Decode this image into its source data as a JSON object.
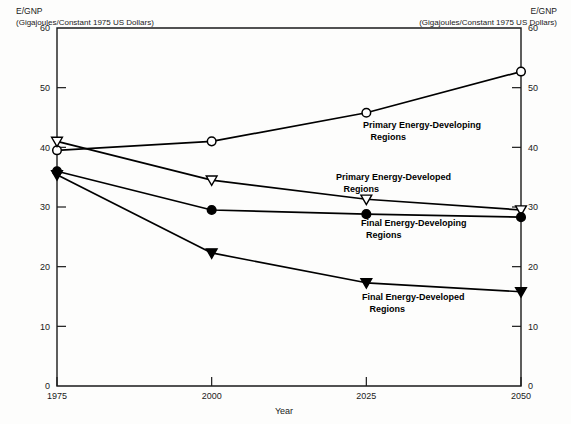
{
  "chart_data": {
    "type": "line",
    "title": "",
    "xlabel": "Year",
    "ylabel": "E/GNP",
    "ylabel_unit": "(Gigajoules/Constant 1975 US Dollars)",
    "x": [
      1975,
      2000,
      2025,
      2050
    ],
    "xtick_labels": [
      "1975",
      "2000",
      "2025",
      "2050"
    ],
    "ytick_labels": [
      "0",
      "10",
      "20",
      "30",
      "40",
      "50",
      "60"
    ],
    "yticks": [
      0,
      10,
      20,
      30,
      40,
      50,
      60
    ],
    "ylim": [
      0,
      60
    ],
    "xlim": [
      1975,
      2050
    ],
    "grid": false,
    "legend_position": "inline-annotations",
    "dual_y_axis": true,
    "series": [
      {
        "name": "Primary Energy-Developing Regions",
        "label": "Primary Energy-Developing\n   Regions",
        "marker": "open-circle",
        "values": [
          39.5,
          41.0,
          45.8,
          52.7
        ]
      },
      {
        "name": "Primary Energy-Developed Regions",
        "label": "Primary Energy-Developed\n   Regions",
        "marker": "open-triangle-down",
        "values": [
          41.0,
          34.5,
          31.3,
          29.5
        ]
      },
      {
        "name": "Final Energy-Developing Regions",
        "label": "Final Energy-Developing\n  Regions",
        "marker": "filled-circle",
        "values": [
          36.0,
          29.5,
          28.8,
          28.3
        ]
      },
      {
        "name": "Final Energy-Developed Regions",
        "label": "Final Energy-Developed\n   Regions",
        "marker": "filled-triangle-down",
        "values": [
          35.4,
          22.3,
          17.3,
          15.8
        ]
      }
    ],
    "colors": {
      "line": "#000000",
      "marker_fill_open": "#ffffff",
      "marker_fill_solid": "#000000",
      "axis": "#1a1a1a",
      "background": "#fdfdfc"
    }
  },
  "axis_captions": {
    "left_line1": "E/GNP",
    "left_line2": "(Gigajoules/Constant 1975 US Dollars)",
    "right_line1": "E/GNP",
    "right_line2": "(Gigajoules/Constant 1975 US Dollars)"
  }
}
